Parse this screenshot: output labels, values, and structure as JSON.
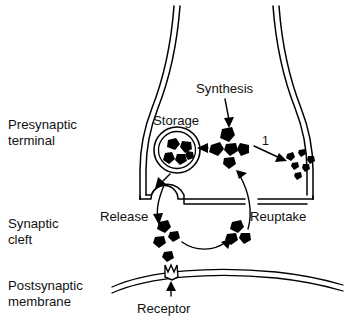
{
  "figure": {
    "type": "diagram",
    "background_color": "#ffffff",
    "line_color": "#000000",
    "text_color": "#111111"
  },
  "region_labels": [
    {
      "id": "presynaptic-terminal",
      "line1": "Presynaptic",
      "line2": "terminal"
    },
    {
      "id": "synaptic-cleft",
      "line1": "Synaptic",
      "line2": "cleft"
    },
    {
      "id": "postsynaptic-membrane",
      "line1": "Postsynaptic",
      "line2": "membrane"
    }
  ],
  "process_labels": {
    "synthesis": "Synthesis",
    "storage": "Storage",
    "release": "Release",
    "reuptake": "Reuptake",
    "receptor": "Receptor",
    "degradation_number": "1"
  },
  "structures": {
    "vesicle_label": "Storage",
    "vesicle_particle_count": 5,
    "cytoplasmic_pool_particle_count": 5,
    "metabolite_particle_count": 6,
    "cleft_release_particle_count": 4,
    "cleft_reuptake_particle_count": 3
  },
  "arrows": [
    {
      "id": "synthesis-arrow",
      "from": "Synthesis",
      "to": "cytoplasmic pool"
    },
    {
      "id": "storage-arrow",
      "from": "cytoplasmic pool",
      "to": "storage vesicle"
    },
    {
      "id": "degradation-arrow",
      "from": "cytoplasmic pool",
      "to": "metabolites",
      "label": "1"
    },
    {
      "id": "release-arrow",
      "from": "storage vesicle",
      "to": "release site"
    },
    {
      "id": "exocytosis-arrow",
      "from": "release site",
      "to": "synaptic cleft"
    },
    {
      "id": "diffusion-arrow",
      "from": "cleft release particles",
      "to": "cleft reuptake particles"
    },
    {
      "id": "reuptake-arrow",
      "from": "synaptic cleft",
      "to": "cytoplasmic pool"
    },
    {
      "id": "receptor-arrow",
      "from": "Receptor",
      "to": "receptor site"
    }
  ]
}
